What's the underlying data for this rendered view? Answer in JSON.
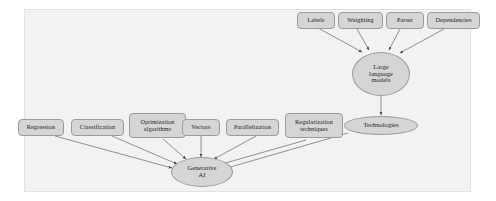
{
  "figure": {
    "background_color": "#ffffff",
    "panel_color": "#f2f2f2",
    "node_fill": "#d5d5d5",
    "node_stroke": "#9b9b9b",
    "edge_color": "#6f6f6f",
    "text_color": "#1a1a1a"
  },
  "nodes": {
    "labels": {
      "label": "Labels",
      "shape": "rounded-box"
    },
    "weighting": {
      "label": "Weighting",
      "shape": "rounded-box"
    },
    "parser": {
      "label": "Parser",
      "shape": "rounded-box"
    },
    "dependencies": {
      "label": "Dependencies",
      "shape": "rounded-box"
    },
    "large_language_models": {
      "label": "Large\nlanguage\nmodels",
      "shape": "ellipse"
    },
    "technologies": {
      "label": "Technologies",
      "shape": "ellipse"
    },
    "regression": {
      "label": "Regression",
      "shape": "rounded-box"
    },
    "classification": {
      "label": "Classification",
      "shape": "rounded-box"
    },
    "optimization_algorithms": {
      "label": "Optimization\nalgorithms",
      "shape": "rounded-box"
    },
    "vectors": {
      "label": "Vectors",
      "shape": "rounded-box"
    },
    "parallelization": {
      "label": "Parallelization",
      "shape": "rounded-box"
    },
    "regularization_techniques": {
      "label": "Regularization\ntechniques",
      "shape": "rounded-box"
    },
    "generative_ai": {
      "label": "Generative\nAI",
      "shape": "ellipse"
    }
  },
  "edges": [
    {
      "from": "labels",
      "to": "large_language_models"
    },
    {
      "from": "weighting",
      "to": "large_language_models"
    },
    {
      "from": "parser",
      "to": "large_language_models"
    },
    {
      "from": "dependencies",
      "to": "large_language_models"
    },
    {
      "from": "large_language_models",
      "to": "technologies"
    },
    {
      "from": "regression",
      "to": "generative_ai"
    },
    {
      "from": "classification",
      "to": "generative_ai"
    },
    {
      "from": "optimization_algorithms",
      "to": "generative_ai"
    },
    {
      "from": "vectors",
      "to": "generative_ai"
    },
    {
      "from": "parallelization",
      "to": "generative_ai"
    },
    {
      "from": "regularization_techniques",
      "to": "generative_ai"
    },
    {
      "from": "technologies",
      "to": "generative_ai"
    }
  ]
}
